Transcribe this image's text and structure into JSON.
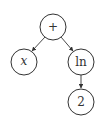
{
  "diagram": {
    "type": "expression-tree",
    "nodes": [
      {
        "id": "plus",
        "label": "+",
        "cx": 53,
        "cy": 27,
        "r": 13
      },
      {
        "id": "x",
        "label": "x",
        "cx": 24,
        "cy": 62,
        "r": 13
      },
      {
        "id": "ln",
        "label": "ln",
        "cx": 81,
        "cy": 62,
        "r": 13
      },
      {
        "id": "two",
        "label": "2",
        "cx": 81,
        "cy": 102,
        "r": 13
      }
    ],
    "edges": [
      {
        "from": "plus",
        "to": "x"
      },
      {
        "from": "plus",
        "to": "ln"
      },
      {
        "from": "ln",
        "to": "two"
      }
    ]
  }
}
